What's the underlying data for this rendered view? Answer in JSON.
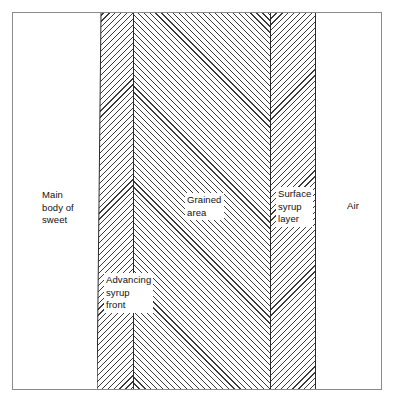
{
  "figure": {
    "background_color": "#ffffff",
    "frame_color": "#8a8a8a",
    "hatch_color": "#3a3a3a",
    "line_color": "#2a2a2a"
  },
  "labels": {
    "main_body": "Main\nbody of\nsweet",
    "advancing_front": "Advancing\nsyrup\nfront",
    "grained_area": "Grained\narea",
    "surface_syrup": "Surface\nsyrup\nlayer",
    "air": "Air"
  },
  "zones": [
    {
      "name": "main-body-of-sweet",
      "label": "Main body of sweet",
      "fill": "none",
      "hatch": "none"
    },
    {
      "name": "advancing-syrup-front",
      "label": "Advancing syrup front",
      "fill": "hatched",
      "hatch": "down-right"
    },
    {
      "name": "grained-area",
      "label": "Grained area",
      "fill": "hatched",
      "hatch": "up-right"
    },
    {
      "name": "surface-syrup-layer",
      "label": "Surface syrup layer",
      "fill": "hatched",
      "hatch": "down-right"
    },
    {
      "name": "air",
      "label": "Air",
      "fill": "none",
      "hatch": "none"
    }
  ]
}
